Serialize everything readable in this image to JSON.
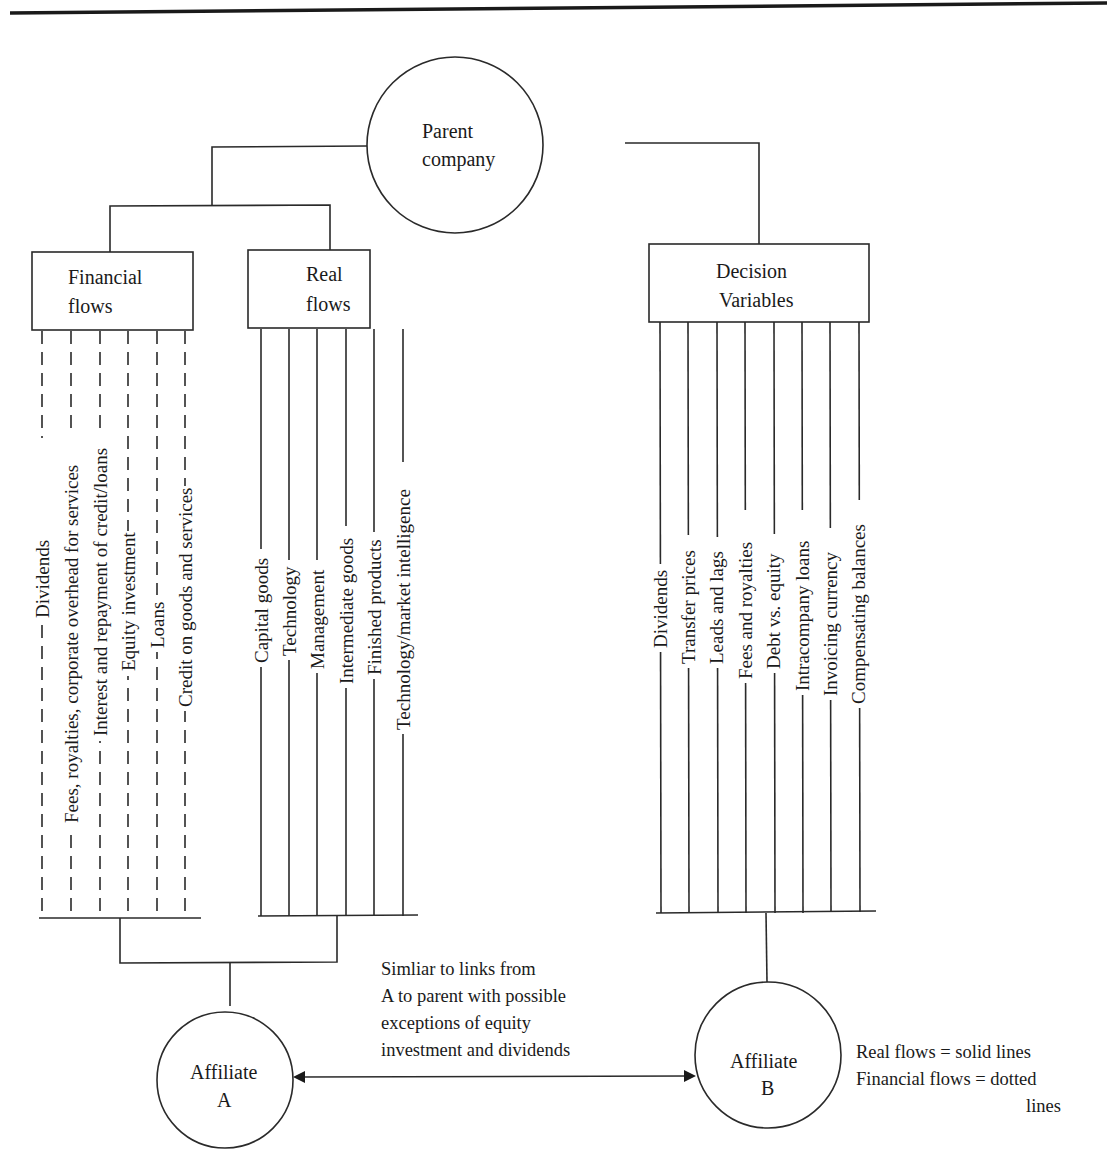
{
  "diagram": {
    "parent": {
      "line1": "Parent",
      "line2": "company"
    },
    "financial_box": {
      "line1": "Financial",
      "line2": "flows"
    },
    "real_box": {
      "line1": "Real",
      "line2": "flows"
    },
    "decision_box": {
      "line1": "Decision",
      "line2": "Variables"
    },
    "financial_flows": [
      "Dividends",
      "Fees, royalties, corporate overhead for services",
      "Interest and repayment of credit/loans",
      "Equity investment",
      "Loans",
      "Credit on goods and services"
    ],
    "real_flows": [
      "Capital goods",
      "Technology",
      "Management",
      "Intermediate goods",
      "Finished products",
      "Technology/market intelligence"
    ],
    "decision_variables": [
      "Dividends",
      "Transfer prices",
      "Leads and lags",
      "Fees and royalties",
      "Debt vs. equity",
      "Intracompany loans",
      "Invoicing currency",
      "Compensating balances"
    ],
    "affiliate_a": {
      "line1": "Affiliate",
      "line2": "A"
    },
    "affiliate_b": {
      "line1": "Affiliate",
      "line2": "B"
    },
    "link_note": [
      "Simliar to links from",
      "A to parent with possible",
      "exceptions of equity",
      "investment and dividends"
    ],
    "legend": {
      "line1": "Real flows = solid lines",
      "line2": "Financial flows = dotted",
      "line3": "lines"
    }
  },
  "colors": {
    "ink": "#2a2a2a",
    "background": "#ffffff"
  }
}
